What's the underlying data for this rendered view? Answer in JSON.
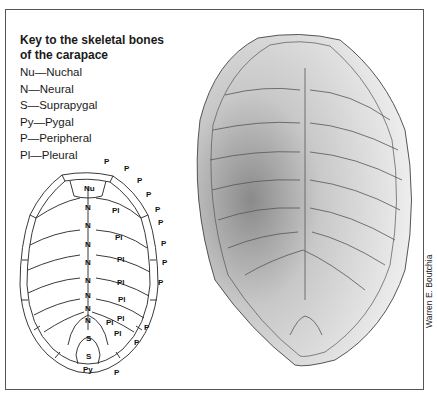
{
  "key": {
    "title_line1": "Key to the skeletal bones",
    "title_line2": "of the carapace",
    "items": [
      {
        "abbr": "Nu",
        "name": "Nuchal",
        "text": "Nu—Nuchal"
      },
      {
        "abbr": "N",
        "name": "Neural",
        "text": "N—Neural"
      },
      {
        "abbr": "S",
        "name": "Suprapygal",
        "text": "S—Suprapygal"
      },
      {
        "abbr": "Py",
        "name": "Pygal",
        "text": "Py—Pygal"
      },
      {
        "abbr": "P",
        "name": "Peripheral",
        "text": "P—Peripheral"
      },
      {
        "abbr": "Pl",
        "name": "Pleural",
        "text": "Pl—Pleural"
      }
    ]
  },
  "diagram": {
    "nuchal_label": "Nu",
    "neural_label": "N",
    "neural_count": 8,
    "pleural_label": "Pl",
    "pleural_count": 8,
    "suprapygal_label": "S",
    "suprapygal_count": 2,
    "pygal_label": "Py",
    "peripheral_label": "P",
    "peripheral_count": 12
  },
  "illustration": {
    "subject": "turtle carapace skeletal bones (stippled drawing)"
  },
  "credit": "Warren E. Boutchia"
}
